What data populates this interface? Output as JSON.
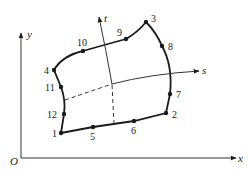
{
  "diagram": {
    "title": "",
    "axes": {
      "x_label": "x",
      "y_label": "y",
      "origin_label": "O",
      "s_label": "s",
      "t_label": "t"
    },
    "nodes": [
      {
        "id": "1",
        "label": "1",
        "x": 61,
        "y": 133
      },
      {
        "id": "2",
        "label": "2",
        "x": 166,
        "y": 113
      },
      {
        "id": "3",
        "label": "3",
        "x": 146,
        "y": 22
      },
      {
        "id": "4",
        "label": "4",
        "x": 54,
        "y": 70
      },
      {
        "id": "5",
        "label": "5",
        "x": 93,
        "y": 127
      },
      {
        "id": "6",
        "label": "6",
        "x": 134,
        "y": 121
      },
      {
        "id": "7",
        "label": "7",
        "x": 170,
        "y": 94
      },
      {
        "id": "8",
        "label": "8",
        "x": 162,
        "y": 46
      },
      {
        "id": "9",
        "label": "9",
        "x": 126,
        "y": 39
      },
      {
        "id": "10",
        "label": "10",
        "x": 83,
        "y": 51
      },
      {
        "id": "11",
        "label": "11",
        "x": 61,
        "y": 87
      },
      {
        "id": "12",
        "label": "12",
        "x": 64,
        "y": 114
      }
    ]
  }
}
